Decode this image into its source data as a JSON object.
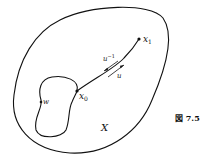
{
  "figure": {
    "caption": "図 7.5",
    "space_label": "X",
    "points": {
      "x0": {
        "label": "x",
        "sub": "0"
      },
      "x1": {
        "label": "x",
        "sub": "1"
      },
      "w": {
        "label": "w"
      }
    },
    "paths": {
      "u": {
        "label": "u"
      },
      "u_inverse": {
        "label": "u",
        "sup": "−1"
      }
    }
  }
}
